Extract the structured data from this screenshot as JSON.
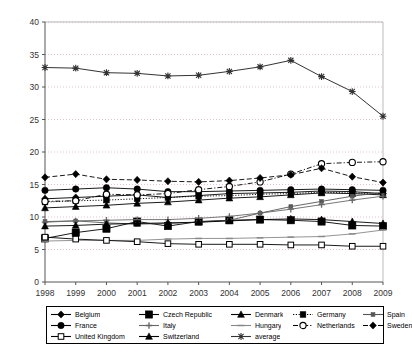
{
  "chart_data": {
    "type": "line",
    "title": "",
    "subtitle": "",
    "xlabel": "",
    "ylabel": "",
    "xlim": [
      1998,
      2009
    ],
    "ylim": [
      0,
      40
    ],
    "ytick_step": 5,
    "yticks": [
      "0",
      "5",
      "10",
      "15",
      "20",
      "25",
      "30",
      "35",
      "40"
    ],
    "grid": true,
    "grid_axis": "y",
    "legend_position": "bottom",
    "legend_columns": 5,
    "legend_rows": 3,
    "categories": [
      "1998",
      "1999",
      "2000",
      "2001",
      "2002",
      "2003",
      "2004",
      "2005",
      "2006",
      "2007",
      "2008",
      "2009"
    ],
    "x": [
      1998,
      1999,
      2000,
      2001,
      2002,
      2003,
      2004,
      2005,
      2006,
      2007,
      2008,
      2009
    ],
    "series": [
      {
        "name": "Belgium",
        "marker": "diamond-filled",
        "dash": "solid",
        "color": "#000000",
        "values": [
          12.8,
          13.0,
          13.2,
          13.4,
          13.0,
          13.3,
          13.6,
          13.7,
          13.8,
          14.0,
          13.9,
          13.6
        ]
      },
      {
        "name": "Czech Republic",
        "marker": "square-filled-large",
        "dash": "solid",
        "color": "#000000",
        "values": [
          6.7,
          7.6,
          8.2,
          9.3,
          8.6,
          9.3,
          9.5,
          9.6,
          9.5,
          9.3,
          8.7,
          8.6
        ]
      },
      {
        "name": "Denmark",
        "marker": "triangle-filled",
        "dash": "solid",
        "color": "#000000",
        "values": [
          11.4,
          11.6,
          11.8,
          12.1,
          12.3,
          12.6,
          12.9,
          13.1,
          13.4,
          13.7,
          13.6,
          13.4
        ]
      },
      {
        "name": "Germany",
        "marker": "square-filled",
        "dash": "dotted",
        "color": "#000000",
        "values": [
          12.3,
          12.5,
          12.6,
          12.8,
          13.0,
          13.2,
          13.3,
          13.5,
          13.6,
          13.8,
          13.7,
          13.6
        ]
      },
      {
        "name": "Spain",
        "marker": "square-filled-small",
        "dash": "solid",
        "color": "#555555",
        "values": [
          9.3,
          9.4,
          9.1,
          8.9,
          9.0,
          9.2,
          9.5,
          10.6,
          11.6,
          12.4,
          13.2,
          13.8
        ]
      },
      {
        "name": "France",
        "marker": "circle-filled",
        "dash": "solid",
        "color": "#000000",
        "values": [
          14.1,
          14.3,
          14.5,
          14.3,
          13.9,
          13.9,
          14.0,
          14.1,
          14.2,
          14.3,
          14.2,
          14.1
        ]
      },
      {
        "name": "Italy",
        "marker": "plus",
        "dash": "solid",
        "color": "#666666",
        "values": [
          9.2,
          9.4,
          9.5,
          9.6,
          9.6,
          9.8,
          10.1,
          10.6,
          11.2,
          11.9,
          12.6,
          13.2
        ]
      },
      {
        "name": "Hungary",
        "marker": "dash",
        "dash": "solid",
        "color": "#888888",
        "values": [
          6.3,
          6.4,
          6.4,
          6.4,
          6.6,
          6.7,
          6.7,
          6.8,
          6.9,
          7.0,
          7.4,
          8.0
        ]
      },
      {
        "name": "Netherlands",
        "marker": "circle-open",
        "dash": "dashdot",
        "color": "#000000",
        "values": [
          12.4,
          12.5,
          13.5,
          13.4,
          13.6,
          14.2,
          14.7,
          15.4,
          16.6,
          18.2,
          18.4,
          18.5
        ]
      },
      {
        "name": "Sweden",
        "marker": "diamond-filled",
        "dash": "dashed",
        "color": "#000000",
        "values": [
          16.1,
          16.6,
          15.8,
          15.7,
          15.5,
          15.4,
          15.6,
          16.0,
          16.5,
          17.5,
          16.2,
          15.3
        ]
      },
      {
        "name": "United Kingdom",
        "marker": "square-open",
        "dash": "solid",
        "color": "#000000",
        "values": [
          6.9,
          6.6,
          6.4,
          6.2,
          5.9,
          5.8,
          5.8,
          5.8,
          5.7,
          5.7,
          5.5,
          5.5
        ]
      },
      {
        "name": "Switzerland",
        "marker": "triangle-filled",
        "dash": "solid",
        "color": "#000000",
        "values": [
          8.6,
          8.7,
          8.9,
          9.0,
          9.1,
          9.2,
          9.4,
          9.6,
          9.7,
          9.6,
          9.3,
          9.0
        ]
      },
      {
        "name": "average",
        "marker": "star-x",
        "dash": "solid",
        "color": "#333333",
        "values": [
          33.0,
          32.9,
          32.2,
          32.1,
          31.7,
          31.8,
          32.4,
          33.1,
          34.1,
          31.6,
          29.3,
          25.5
        ]
      }
    ]
  },
  "legend": {
    "entries": [
      "Belgium",
      "Czech Republic",
      "Denmark",
      "Germany",
      "Spain",
      "France",
      "Italy",
      "Hungary",
      "Netherlands",
      "Sweden",
      "United Kingdom",
      "Switzerland",
      "average"
    ]
  }
}
